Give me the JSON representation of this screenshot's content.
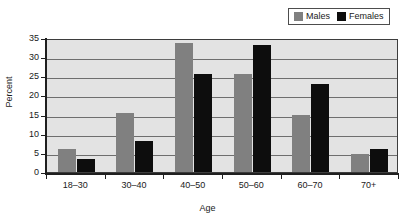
{
  "chart_data": {
    "type": "bar",
    "title": "",
    "xlabel": "Age",
    "ylabel": "Percent",
    "categories": [
      "18‒30",
      "30‒40",
      "40‒50",
      "50‒60",
      "60‒70",
      "70+"
    ],
    "series": [
      {
        "name": "Males",
        "color": "#808080",
        "values": [
          6.0,
          15.3,
          33.7,
          25.5,
          15.0,
          4.8
        ]
      },
      {
        "name": "Females",
        "color": "#0d0d0d",
        "values": [
          3.5,
          8.2,
          25.5,
          33.2,
          23.0,
          6.0
        ]
      }
    ],
    "ylim": [
      0,
      35
    ],
    "ytick_labels": [
      "0",
      "5",
      "10",
      "15",
      "20",
      "25",
      "30",
      "35"
    ],
    "ytick_values": [
      0,
      5,
      10,
      15,
      20,
      25,
      30,
      35
    ],
    "grid": true,
    "legend_position": "top-right",
    "plot_background": "#e3e3e3"
  },
  "legend": {
    "entries": [
      {
        "label": "Males"
      },
      {
        "label": "Females"
      }
    ]
  },
  "axes": {
    "y_title": "Percent",
    "x_title": "Age"
  }
}
